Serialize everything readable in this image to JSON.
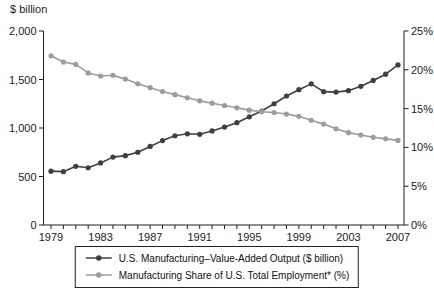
{
  "header": {
    "left_axis_unit": "$ billion"
  },
  "chart_data": {
    "type": "line",
    "title": "",
    "xlabel": "",
    "ylabel_left": "$ billion",
    "ylabel_right": "%",
    "grid": false,
    "legend_position": "bottom",
    "x_years": [
      1979,
      1980,
      1981,
      1982,
      1983,
      1984,
      1985,
      1986,
      1987,
      1988,
      1989,
      1990,
      1991,
      1992,
      1993,
      1994,
      1995,
      1996,
      1997,
      1998,
      1999,
      2000,
      2001,
      2002,
      2003,
      2004,
      2005,
      2006,
      2007
    ],
    "x_tick_years": [
      1979,
      1983,
      1987,
      1991,
      1995,
      1999,
      2003,
      2007
    ],
    "left_axis": {
      "min": 0,
      "max": 2000,
      "tick_values": [
        0,
        500,
        1000,
        1500,
        2000
      ],
      "tick_labels": [
        "0",
        "500",
        "1,000",
        "1,500",
        "2,000"
      ]
    },
    "right_axis": {
      "min": 0,
      "max": 25,
      "tick_values": [
        0,
        5,
        10,
        15,
        20,
        25
      ],
      "tick_labels": [
        "0%",
        "5%",
        "10%",
        "15%",
        "20%",
        "25%"
      ]
    },
    "series": [
      {
        "name": "U.S. Manufacturing–Value-Added Output ($ billion)",
        "axis": "left",
        "color": "#3f3f3f",
        "marker": "circle",
        "values": [
          555,
          550,
          605,
          590,
          640,
          700,
          715,
          750,
          810,
          870,
          920,
          940,
          935,
          970,
          1010,
          1055,
          1115,
          1175,
          1250,
          1330,
          1395,
          1455,
          1375,
          1370,
          1385,
          1430,
          1490,
          1555,
          1650
        ]
      },
      {
        "name": "Manufacturing Share of U.S. Total Employment* (%)",
        "axis": "right",
        "color": "#9c9c9c",
        "marker": "circle",
        "values": [
          21.8,
          21.0,
          20.7,
          19.6,
          19.2,
          19.3,
          18.8,
          18.2,
          17.7,
          17.2,
          16.8,
          16.4,
          16.0,
          15.7,
          15.4,
          15.1,
          14.8,
          14.6,
          14.5,
          14.3,
          14.0,
          13.5,
          13.0,
          12.4,
          11.9,
          11.6,
          11.3,
          11.1,
          10.9
        ]
      }
    ]
  }
}
